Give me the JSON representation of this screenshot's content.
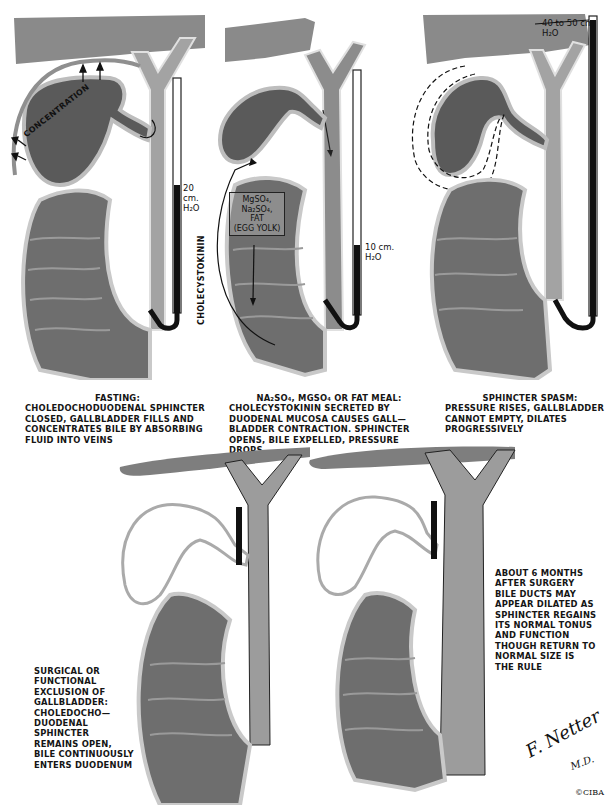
{
  "figure": {
    "panels": [
      {
        "id": "fasting",
        "caption_title": "FASTING:",
        "caption_lines": [
          "CHOLEDOCHODUODENAL SPHINCTER",
          "CLOSED, GALLBLADDER FILLS AND",
          "CONCENTRATES BILE BY ABSORBING",
          "FLUID INTO VEINS"
        ],
        "gauge_label": "20 cm.",
        "gauge_unit": "H₂O",
        "annotation": "CONCENTRATION"
      },
      {
        "id": "fat-meal",
        "caption_title": "Na₂SO₄, MgSO₄ OR FAT MEAL:",
        "caption_lines": [
          "CHOLECYSTOKININ SECRETED BY",
          "DUODENAL MUCOSA CAUSES GALL—",
          "BLADDER CONTRACTION. SPHINCTER",
          "OPENS, BILE EXPELLED, PRESSURE DROPS"
        ],
        "gauge_label": "10 cm.",
        "gauge_unit": "H₂O",
        "box_lines": [
          "MgSO₄,",
          "Na₂SO₄,",
          "FAT",
          "(EGG YOLK)"
        ],
        "annotation": "CHOLECYSTOKININ"
      },
      {
        "id": "sphincter-spasm",
        "caption_title": "SPHINCTER SPASM:",
        "caption_lines": [
          "PRESSURE RISES, GALLBLADDER",
          "CANNOT EMPTY, DILATES",
          "PROGRESSIVELY"
        ],
        "gauge_label": "40 to 50 cm.",
        "gauge_unit": "H₂O"
      },
      {
        "id": "surgical-exclusion",
        "caption_lines": [
          "SURGICAL OR",
          "FUNCTIONAL",
          "EXCLUSION OF",
          "GALLBLADDER:",
          "CHOLEDOCHO—",
          "DUODENAL",
          "SPHINCTER",
          "REMAINS OPEN,",
          "BILE CONTINUOUSLY",
          "ENTERS DUODENUM"
        ]
      },
      {
        "id": "post-surgery",
        "caption_lines": [
          "ABOUT 6 MONTHS",
          "AFTER SURGERY",
          "BILE DUCTS MAY",
          "APPEAR DILATED AS",
          "SPHINCTER REGAINS",
          "ITS NORMAL TONUS",
          "AND FUNCTION",
          "THOUGH RETURN TO",
          "NORMAL SIZE IS",
          "THE RULE"
        ]
      }
    ],
    "signature": {
      "name": "F. Netter",
      "suffix": "M.D.",
      "copyright": "©CIBA"
    },
    "colors": {
      "liver": "#8a8a8a",
      "duct": "#9c9c9c",
      "duct_edge": "#d8d8d8",
      "gallbladder": "#555555",
      "duodenum": "#6e6e6e",
      "gauge_fill": "#111111"
    }
  }
}
